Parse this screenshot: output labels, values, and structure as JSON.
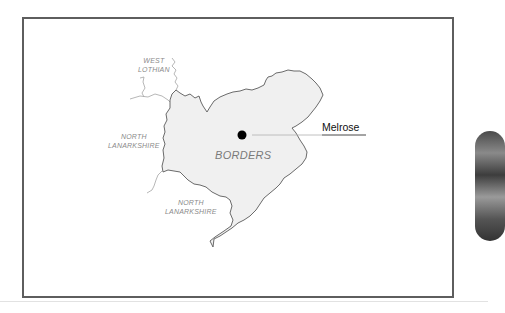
{
  "map": {
    "main_region": "BORDERS",
    "town": {
      "name": "Melrose",
      "marker_color": "#000000"
    },
    "neighbors": [
      {
        "label_line1": "WEST",
        "label_line2": "LOTHIAN"
      },
      {
        "label_line1": "NORTH",
        "label_line2": "LANARKSHIRE"
      },
      {
        "label_line1": "NORTH",
        "label_line2": "LANARKSHIRE"
      }
    ],
    "colors": {
      "region_fill": "#f0f0f0",
      "border_stroke": "#555555",
      "neighbor_stroke": "#a0a0a0",
      "frame": "#5e5e5e"
    }
  }
}
